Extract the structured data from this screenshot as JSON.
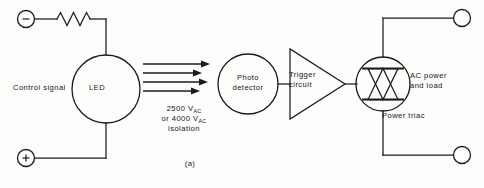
{
  "figure": {
    "domain": "Diagram",
    "kind": "schematic",
    "title_caption": "(a)",
    "background_color": "#fdfdfb",
    "line_color": "#1b1b1b"
  },
  "labels": {
    "control_signal": "Control signal",
    "led": "LED",
    "photo_detector_line1": "Photo",
    "photo_detector_line2": "detector",
    "trigger_circuit_line1": "Trigger",
    "trigger_circuit_line2": "circuit",
    "ac_power_line1": "AC power",
    "ac_power_line2": "and load",
    "power_triac": "Power  triac",
    "isolation_line1_value": "2500",
    "isolation_line1_unit": "V",
    "isolation_line1_sub": "AC",
    "isolation_line2_prefix": "or",
    "isolation_line2_value": "4000",
    "isolation_line2_unit": "V",
    "isolation_line2_sub": "AC",
    "isolation_line3": "isolation",
    "caption": "(a)"
  },
  "terminals": [
    {
      "name": "input-negative",
      "polarity": "minus",
      "x": 26,
      "y": 19
    },
    {
      "name": "input-positive",
      "polarity": "plus",
      "x": 26,
      "y": 158
    },
    {
      "name": "output-top",
      "polarity": "none",
      "x": 462,
      "y": 18
    },
    {
      "name": "output-bottom",
      "polarity": "none",
      "x": 462,
      "y": 155
    }
  ],
  "components": [
    {
      "name": "resistor",
      "type": "resistor",
      "label": ""
    },
    {
      "name": "led-block",
      "type": "circle-block",
      "label": "LED"
    },
    {
      "name": "photo-detector",
      "type": "circle-block",
      "label": "Photo detector"
    },
    {
      "name": "trigger-circuit",
      "type": "triangle-block",
      "label": "Trigger circuit"
    },
    {
      "name": "power-triac",
      "type": "triac",
      "label": "Power  triac"
    }
  ],
  "light_arrows": {
    "name": "optical-coupling-arrows",
    "count": 4,
    "direction": "right",
    "meaning": "light transmission across isolation barrier"
  },
  "icon_names": [
    "terminal-node-icon",
    "resistor-icon",
    "led-circle-icon",
    "photo-detector-circle-icon",
    "trigger-triangle-icon",
    "triac-icon",
    "light-arrow-icon"
  ]
}
